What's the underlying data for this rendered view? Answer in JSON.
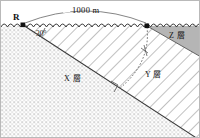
{
  "figure": {
    "kind": "geological-cross-section",
    "width": 200,
    "height": 138,
    "border_color": "#b9b9b9",
    "background": "#ffffff"
  },
  "labels": {
    "point_r": "R",
    "distance": "1000 m",
    "angle": "30°",
    "layer_x": "X 層",
    "layer_y": "Y 層",
    "layer_z": "Z 層"
  },
  "annotations": {
    "surface_style": "wavy-ground-line",
    "measure_arc": "span-arc-between-R-and-right-point",
    "angle_arc": "angle-between-surface-and-dipping-boundary",
    "perpendicular_marker": "right-angle-square",
    "dotted_curve": "dotted-arc-from-surface-to-boundary"
  },
  "markers": [
    {
      "name": "point-r-marker",
      "x": 22,
      "y": 24
    },
    {
      "name": "point-right-marker",
      "x": 146,
      "y": 25
    }
  ],
  "colors": {
    "ink": "#333333",
    "stipple": "#9a9a9a",
    "hatch": "#8d8d8d",
    "layer_z_fill": "#b5b5b5",
    "label_text": "#111111"
  },
  "regions": [
    {
      "name": "layer-x",
      "fill": "stipple-dots",
      "label": "X 層"
    },
    {
      "name": "layer-y",
      "fill": "diagonal-hatch",
      "label": "Y 層"
    },
    {
      "name": "layer-z",
      "fill": "solid-gray",
      "label": "Z 層"
    }
  ]
}
